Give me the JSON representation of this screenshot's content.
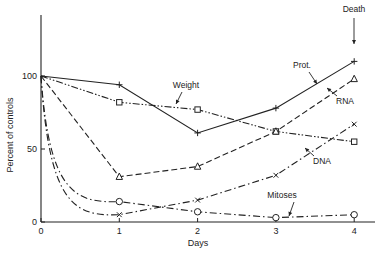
{
  "chart_data": {
    "type": "line",
    "title": "",
    "xlabel": "Days",
    "ylabel": "Percent of controls",
    "x": [
      0,
      1,
      2,
      3,
      4
    ],
    "xticks": [
      "0",
      "1",
      "2",
      "3",
      "4"
    ],
    "yticks": [
      "0",
      "50",
      "100"
    ],
    "xlim": [
      0,
      4.3
    ],
    "ylim": [
      0,
      145
    ],
    "grid": false,
    "legend": "inline labels",
    "series": [
      {
        "name": "Prot.",
        "marker": "plus",
        "style": "solid",
        "values": [
          100,
          94,
          61,
          78,
          110
        ]
      },
      {
        "name": "Weight",
        "marker": "square",
        "style": "dash-dot-dot",
        "values": [
          100,
          82,
          77,
          62,
          55
        ]
      },
      {
        "name": "RNA",
        "marker": "triangle",
        "style": "dashed",
        "values": [
          100,
          31,
          38,
          62,
          98
        ]
      },
      {
        "name": "DNA",
        "marker": "x",
        "style": "dash-dot",
        "values": [
          100,
          5,
          15,
          32,
          67
        ]
      },
      {
        "name": "Mitoses",
        "marker": "circle",
        "style": "dash-dot",
        "values": [
          100,
          14,
          7,
          3,
          5
        ]
      }
    ],
    "annotations": [
      {
        "text": "Death",
        "x": 4,
        "arrow": "down"
      },
      {
        "text": "Prot.",
        "target": "Prot."
      },
      {
        "text": "Weight",
        "target": "Weight"
      },
      {
        "text": "RNA",
        "target": "RNA"
      },
      {
        "text": "DNA",
        "target": "DNA"
      },
      {
        "text": "Mitoses",
        "target": "Mitoses"
      }
    ]
  }
}
